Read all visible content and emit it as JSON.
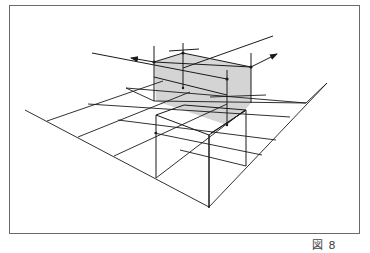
{
  "figure": {
    "caption": "図 8",
    "colors": {
      "line": "#1a1a1a",
      "shade": "#d4d4d4",
      "frame": "#6a6a6a",
      "background": "#ffffff"
    }
  }
}
